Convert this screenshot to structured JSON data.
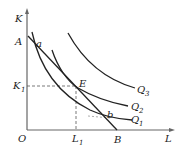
{
  "diagram": {
    "type": "isoquant-isocost",
    "axes": {
      "y_label": "K",
      "x_label": "L",
      "origin_label": "O"
    },
    "points": {
      "A": "A",
      "B": "B",
      "E": "E",
      "a": "a",
      "b": "b"
    },
    "levels": {
      "K1": {
        "main": "K",
        "sub": "1"
      },
      "L1": {
        "main": "L",
        "sub": "1"
      }
    },
    "isoquants": [
      {
        "main": "Q",
        "sub": "1"
      },
      {
        "main": "Q",
        "sub": "2"
      },
      {
        "main": "Q",
        "sub": "3"
      }
    ],
    "colors": {
      "line": "#222222",
      "axis": "#555555",
      "dashed": "#555555"
    }
  }
}
